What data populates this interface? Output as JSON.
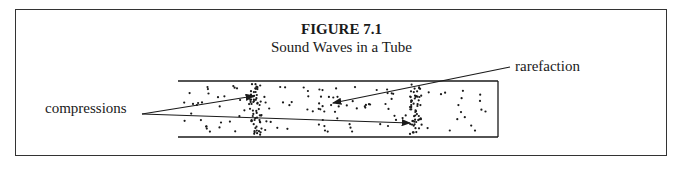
{
  "figure": {
    "title": "FIGURE 7.1",
    "subtitle": "Sound Waves in a Tube"
  },
  "labels": {
    "compressions": "compressions",
    "rarefaction": "rarefaction"
  },
  "diagram": {
    "tube": {
      "x": 178,
      "y": 81,
      "width": 320,
      "height": 56
    },
    "compression_bands_x": [
      256,
      416
    ],
    "colors": {
      "ink": "#1a1a1a",
      "background": "#ffffff"
    }
  }
}
